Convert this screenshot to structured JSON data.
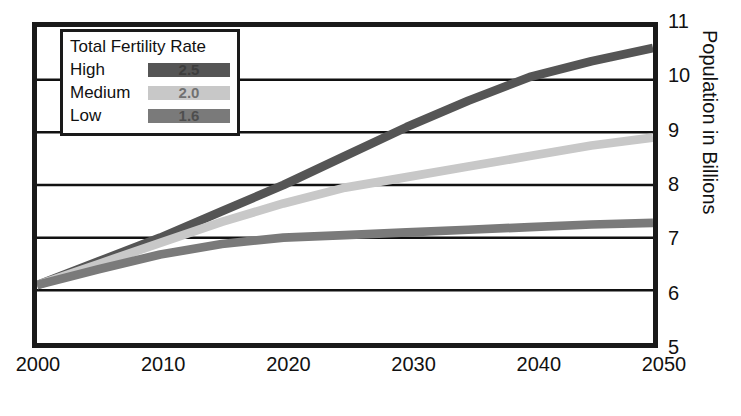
{
  "chart_data": {
    "type": "line",
    "title": "",
    "xlabel": "",
    "ylabel": "Population in Billions",
    "x": [
      2000,
      2010,
      2020,
      2030,
      2040,
      2050
    ],
    "xlim": [
      2000,
      2050
    ],
    "ylim": [
      5,
      11
    ],
    "yticks": [
      5,
      6,
      7,
      8,
      9,
      10,
      11
    ],
    "xticks": [
      2000,
      2010,
      2020,
      2030,
      2040,
      2050
    ],
    "grid": "horizontal",
    "legend_position": "top-left",
    "legend_title": "Total Fertility Rate",
    "series": [
      {
        "name": "High",
        "fertility_rate": "2.5",
        "color": "#555555",
        "x": [
          2000,
          2005,
          2010,
          2015,
          2020,
          2025,
          2030,
          2035,
          2040,
          2045,
          2050
        ],
        "values": [
          6.1,
          6.55,
          7.0,
          7.5,
          8.0,
          8.55,
          9.1,
          9.6,
          10.05,
          10.35,
          10.6
        ]
      },
      {
        "name": "Medium",
        "fertility_rate": "2.0",
        "color": "#c8c8c8",
        "x": [
          2000,
          2005,
          2010,
          2015,
          2020,
          2025,
          2030,
          2035,
          2040,
          2045,
          2050
        ],
        "values": [
          6.1,
          6.5,
          6.9,
          7.3,
          7.65,
          7.95,
          8.15,
          8.35,
          8.55,
          8.75,
          8.9
        ]
      },
      {
        "name": "Low",
        "fertility_rate": "1.6",
        "color": "#7a7a7a",
        "x": [
          2000,
          2005,
          2010,
          2015,
          2020,
          2025,
          2030,
          2035,
          2040,
          2045,
          2050
        ],
        "values": [
          6.1,
          6.4,
          6.68,
          6.88,
          7.0,
          7.05,
          7.1,
          7.15,
          7.2,
          7.25,
          7.28
        ]
      }
    ]
  },
  "axis": {
    "y_title": "Population in Billions",
    "y_labels": [
      "11",
      "10",
      "9",
      "8",
      "7",
      "6",
      "5"
    ],
    "x_labels": [
      "2000",
      "2010",
      "2020",
      "2030",
      "2040",
      "2050"
    ]
  },
  "legend": {
    "title": "Total Fertility Rate",
    "rows": [
      {
        "label": "High",
        "value": "2.5",
        "color": "#555555"
      },
      {
        "label": "Medium",
        "value": "2.0",
        "color": "#c8c8c8"
      },
      {
        "label": "Low",
        "value": "1.6",
        "color": "#7a7a7a"
      }
    ]
  },
  "style": {
    "frame_color": "#1a1a1a",
    "gridline_color": "#111111",
    "background": "#ffffff"
  }
}
